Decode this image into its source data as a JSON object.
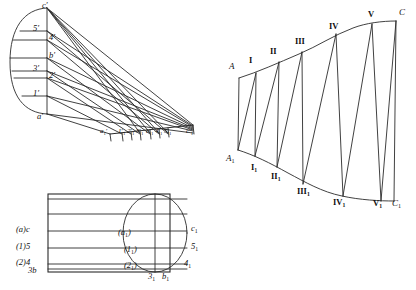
{
  "figure": {
    "stroke_color": "#2b2b2b",
    "background_color": "#ffffff"
  },
  "front_view": {
    "name": "front-view-elevation",
    "ellipse_labels": [
      {
        "id": "c-prime",
        "text": "c′",
        "x": 42,
        "y": 1
      },
      {
        "id": "5-prime",
        "text": "5′",
        "x": 33,
        "y": 24
      },
      {
        "id": "4-prime",
        "text": "4′",
        "x": 49,
        "y": 33
      },
      {
        "id": "b-prime",
        "text": "b′",
        "x": 49,
        "y": 51
      },
      {
        "id": "3-prime",
        "text": "3′",
        "x": 33,
        "y": 64
      },
      {
        "id": "2-prime",
        "text": "2′",
        "x": 49,
        "y": 71
      },
      {
        "id": "1-prime",
        "text": "1′",
        "x": 33,
        "y": 89
      },
      {
        "id": "a-prime",
        "text": "a′",
        "x": 37,
        "y": 112
      }
    ],
    "base_labels": [
      {
        "id": "a1-prime",
        "text": "a",
        "sub": "1",
        "prime": true,
        "x": 100,
        "y": 128
      },
      {
        "id": "1-1-prime",
        "text": "1",
        "sub": "1",
        "prime": true,
        "x": 118,
        "y": 128
      },
      {
        "id": "2-1-prime",
        "text": "2",
        "sub": "1",
        "prime": true,
        "x": 127,
        "y": 128
      },
      {
        "id": "3-1-prime",
        "text": "3",
        "sub": "1",
        "prime": true,
        "x": 136,
        "y": 128
      },
      {
        "id": "b-1-prime",
        "text": "b",
        "sub": "1",
        "prime": true,
        "x": 146,
        "y": 128
      },
      {
        "id": "4-1-prime",
        "text": "4",
        "sub": "1",
        "prime": true,
        "x": 155,
        "y": 128
      },
      {
        "id": "5-1-prime",
        "text": "5",
        "sub": "1",
        "prime": true,
        "x": 164,
        "y": 128
      },
      {
        "id": "c-1-prime",
        "text": "c",
        "sub": "1",
        "prime": true,
        "x": 186,
        "y": 128
      }
    ]
  },
  "plan_view": {
    "name": "plan-view",
    "left_labels": [
      {
        "id": "plan-ac",
        "text": "(a)c",
        "x": 16,
        "y": 228
      },
      {
        "id": "plan-15",
        "text": "(1)5",
        "x": 16,
        "y": 245
      },
      {
        "id": "plan-24",
        "text": "(2)4",
        "x": 16,
        "y": 262
      },
      {
        "id": "plan-3b",
        "text": "3b",
        "x": 26,
        "y": 271
      }
    ],
    "inner_labels": [
      {
        "id": "plan-a1",
        "text": "(a",
        "sub": "1",
        "close": ")",
        "x": 120,
        "y": 233
      },
      {
        "id": "plan-11",
        "text": "(1",
        "sub": "1",
        "close": ")",
        "x": 126,
        "y": 250
      },
      {
        "id": "plan-21",
        "text": "(2",
        "sub": "1",
        "close": ")",
        "x": 126,
        "y": 266
      }
    ],
    "bottom_labels": [
      {
        "id": "plan-31",
        "text": "3",
        "sub": "1",
        "x": 150,
        "y": 274
      },
      {
        "id": "plan-b1",
        "text": "b",
        "sub": "1",
        "x": 164,
        "y": 274
      }
    ],
    "right_labels": [
      {
        "id": "plan-c1",
        "text": "c",
        "sub": "1",
        "x": 192,
        "y": 228
      },
      {
        "id": "plan-51",
        "text": "5",
        "sub": "1",
        "x": 192,
        "y": 246
      },
      {
        "id": "plan-41",
        "text": "4",
        "sub": "1",
        "x": 186,
        "y": 263
      }
    ]
  },
  "development": {
    "name": "surface-development",
    "top_labels": [
      {
        "id": "dev-A",
        "text": "A",
        "roman": false,
        "x": 231,
        "y": 64
      },
      {
        "id": "dev-I",
        "text": "I",
        "roman": true,
        "x": 250,
        "y": 58
      },
      {
        "id": "dev-II",
        "text": "II",
        "roman": true,
        "x": 272,
        "y": 50
      },
      {
        "id": "dev-III",
        "text": "III",
        "roman": true,
        "x": 297,
        "y": 40
      },
      {
        "id": "dev-IV",
        "text": "IV",
        "roman": true,
        "x": 330,
        "y": 25
      },
      {
        "id": "dev-V",
        "text": "V",
        "roman": true,
        "x": 368,
        "y": 13
      },
      {
        "id": "dev-C",
        "text": "C",
        "roman": false,
        "x": 400,
        "y": 11
      }
    ],
    "bottom_labels": [
      {
        "id": "dev-A1",
        "text": "A",
        "sub": "1",
        "roman": false,
        "x": 228,
        "y": 157
      },
      {
        "id": "dev-I1",
        "text": "I",
        "sub": "1",
        "roman": true,
        "x": 252,
        "y": 166
      },
      {
        "id": "dev-II1",
        "text": "II",
        "sub": "1",
        "roman": true,
        "x": 272,
        "y": 175
      },
      {
        "id": "dev-III1",
        "text": "III",
        "sub": "1",
        "roman": true,
        "x": 299,
        "y": 190
      },
      {
        "id": "dev-IV1",
        "text": "IV",
        "sub": "1",
        "roman": true,
        "x": 334,
        "y": 200
      },
      {
        "id": "dev-V1",
        "text": "V",
        "sub": "1",
        "roman": true,
        "x": 374,
        "y": 202
      },
      {
        "id": "dev-C1",
        "text": "C",
        "sub": "1",
        "roman": false,
        "x": 394,
        "y": 202
      }
    ]
  }
}
